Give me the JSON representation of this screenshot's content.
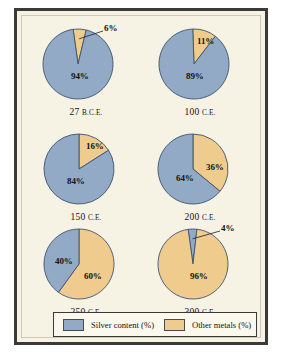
{
  "chart_data": {
    "type": "pie",
    "title": "",
    "series_names": [
      "Silver content (%)",
      "Other metals (%)"
    ],
    "colors": {
      "silver": "#93aac6",
      "other": "#efcb8d",
      "stroke": "#3d5470",
      "frame": "#3b3a36",
      "background": "#f6f2e4"
    },
    "legend_position": "bottom",
    "charts": [
      {
        "year": "27",
        "era": "B.C.E.",
        "label": "27 B.C.E.",
        "slices": [
          {
            "name": "Silver content (%)",
            "value": 94,
            "label": "94%"
          },
          {
            "name": "Other metals (%)",
            "value": 6,
            "label": "6%"
          }
        ],
        "callout": "6%"
      },
      {
        "year": "100",
        "era": "C.E.",
        "label": "100 C.E.",
        "slices": [
          {
            "name": "Silver content (%)",
            "value": 89,
            "label": "89%"
          },
          {
            "name": "Other metals (%)",
            "value": 11,
            "label": "11%"
          }
        ],
        "callout": null
      },
      {
        "year": "150",
        "era": "C.E.",
        "label": "150 C.E.",
        "slices": [
          {
            "name": "Silver content (%)",
            "value": 84,
            "label": "84%"
          },
          {
            "name": "Other metals (%)",
            "value": 16,
            "label": "16%"
          }
        ],
        "callout": null
      },
      {
        "year": "200",
        "era": "C.E.",
        "label": "200 C.E.",
        "slices": [
          {
            "name": "Silver content (%)",
            "value": 64,
            "label": "64%"
          },
          {
            "name": "Other metals (%)",
            "value": 36,
            "label": "36%"
          }
        ],
        "callout": null
      },
      {
        "year": "250",
        "era": "C.E.",
        "label": "250 C.E.",
        "slices": [
          {
            "name": "Silver content (%)",
            "value": 40,
            "label": "40%"
          },
          {
            "name": "Other metals (%)",
            "value": 60,
            "label": "60%"
          }
        ],
        "callout": null
      },
      {
        "year": "300",
        "era": "C.E.",
        "label": "300 C.E.",
        "slices": [
          {
            "name": "Silver content (%)",
            "value": 4,
            "label": "4%"
          },
          {
            "name": "Other metals (%)",
            "value": 96,
            "label": "96%"
          }
        ],
        "callout": "4%"
      }
    ]
  },
  "legend": {
    "items": [
      {
        "label": "Silver content (%)",
        "color": "#93aac6",
        "name": "silver"
      },
      {
        "label": "Other metals (%)",
        "color": "#efcb8d",
        "name": "other"
      }
    ]
  }
}
